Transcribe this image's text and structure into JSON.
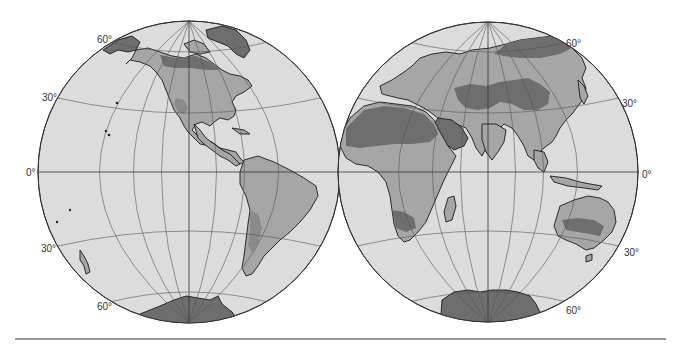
{
  "figure": {
    "type": "interrupted-hemisphere world map",
    "colors": {
      "background": "#ffffff",
      "ocean": "#dcdcdc",
      "land_light": "#a6a6a6",
      "land_medium": "#8a8a8a",
      "land_dark": "#6e6e6e",
      "graticule": "#555555",
      "outline": "#1a1a1a",
      "rule": "#333333"
    },
    "hemispheres": [
      {
        "name": "western-hemisphere",
        "labels": {
          "lat_60n": "60°",
          "lat_30n": "30°",
          "equator": "0°",
          "lat_30s": "30°",
          "lat_60s": "60°"
        },
        "regions": [
          "North America",
          "Greenland",
          "Central America",
          "South America",
          "Antarctic Peninsula",
          "New Zealand",
          "Hawaii"
        ]
      },
      {
        "name": "eastern-hemisphere",
        "labels": {
          "lat_60n": "60°",
          "lat_30n": "30°",
          "equator": "0°",
          "lat_30s": "30°",
          "lat_60s": "60°"
        },
        "regions": [
          "Europe",
          "Asia",
          "Africa",
          "Arabia",
          "India",
          "Southeast Asia",
          "Australia",
          "Madagascar",
          "Antarctica"
        ]
      }
    ]
  }
}
